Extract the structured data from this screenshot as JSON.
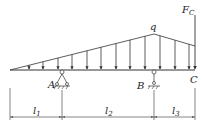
{
  "diagram": {
    "type": "beam-loading",
    "labels": {
      "load_peak": "q",
      "force": "F",
      "force_sub": "C",
      "support_a": "A",
      "support_b": "B",
      "point_c": "C"
    },
    "dimensions": [
      {
        "label": "l",
        "sub": "1"
      },
      {
        "label": "l",
        "sub": "2"
      },
      {
        "label": "l",
        "sub": "3"
      }
    ],
    "colors": {
      "line": "#333333",
      "background": "#ffffff"
    }
  }
}
